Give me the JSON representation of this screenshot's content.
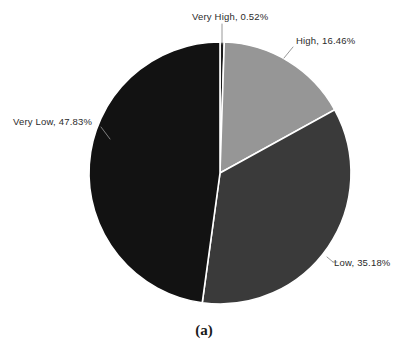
{
  "figure": {
    "caption": "(a)",
    "background_color": "#ffffff"
  },
  "chart_data": {
    "type": "pie",
    "title": "",
    "xlabel": "",
    "ylabel": "",
    "grid": false,
    "legend_position": "none",
    "label_format": "{name}, {value}%",
    "start_angle_deg": 0,
    "direction": "clockwise",
    "categories": [
      "Very High",
      "High",
      "Low",
      "Very Low"
    ],
    "values": [
      0.52,
      16.46,
      35.18,
      47.83
    ],
    "units": "percent",
    "total": 99.99,
    "slices": [
      {
        "name": "Very High",
        "value": 0.52,
        "value_text": "0.52%",
        "label": "Very High, 0.52%",
        "color": "#1a1a1a",
        "leader_line": true
      },
      {
        "name": "High",
        "value": 16.46,
        "value_text": "16.46%",
        "label": "High, 16.46%",
        "color": "#969696",
        "leader_line": true
      },
      {
        "name": "Low",
        "value": 35.18,
        "value_text": "35.18%",
        "label": "Low, 35.18%",
        "color": "#3a3a3a",
        "leader_line": true
      },
      {
        "name": "Very Low",
        "value": 47.83,
        "value_text": "47.83%",
        "label": "Very Low, 47.83%",
        "color": "#121212",
        "leader_line": true
      }
    ],
    "slice_separator_color": "#ffffff",
    "leader_line_color": "#8c8c8c",
    "geometry": {
      "center_x": 220,
      "center_y": 173,
      "radius": 131
    }
  }
}
